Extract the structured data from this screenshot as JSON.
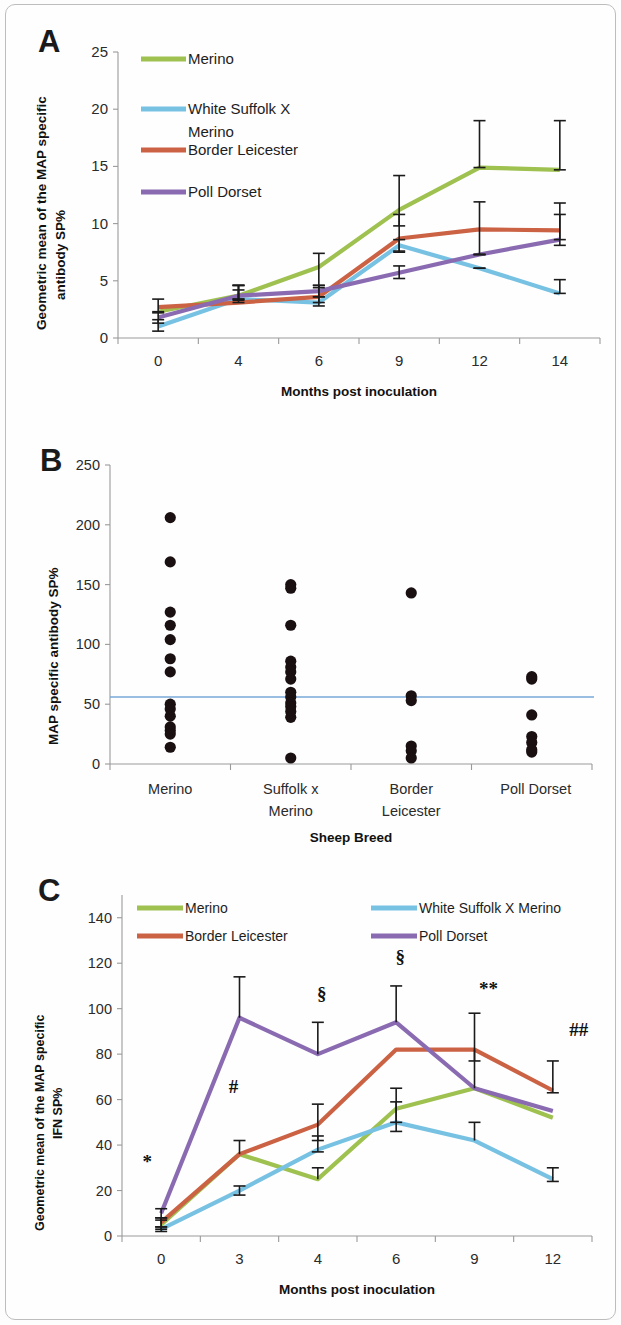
{
  "figure": {
    "panels": [
      "A",
      "B",
      "C"
    ],
    "colors": {
      "merino": "#9ec150",
      "white_suffolk_x_merino": "#77c1e3",
      "border_leicester": "#cb6244",
      "poll_dorset": "#8a6bb1",
      "threshold": "#77a9d8",
      "dot": "#1a1012",
      "axis": "#9a9a9a",
      "text": "#1d1d1d"
    }
  },
  "panel_a": {
    "letter": "A",
    "legend": [
      {
        "label": "Merino",
        "color_key": "merino"
      },
      {
        "label": "White Suffolk X Merino",
        "color_key": "white_suffolk_x_merino"
      },
      {
        "label": "Border Leicester",
        "color_key": "border_leicester"
      },
      {
        "label": "Poll Dorset",
        "color_key": "poll_dorset"
      }
    ],
    "chart_data": {
      "type": "line",
      "title": "",
      "xlabel": "Months post inoculation",
      "ylabel": "Geometric mean of the MAP specific antibody SP%",
      "categories": [
        "0",
        "4",
        "6",
        "9",
        "12",
        "14"
      ],
      "ylim": [
        0,
        25
      ],
      "yticks": [
        0,
        5,
        10,
        15,
        20,
        25
      ],
      "grid": false,
      "legend_position": "top-left inside",
      "series": [
        {
          "name": "Merino",
          "color_key": "merino",
          "values": [
            2.3,
            3.7,
            6.2,
            11.2,
            14.9,
            14.7
          ],
          "err_lower": [
            null,
            3.3,
            4.4,
            9.8,
            14.9,
            14.7
          ],
          "err_upper": [
            null,
            4.2,
            7.4,
            14.2,
            19.0,
            19.0
          ]
        },
        {
          "name": "White Suffolk X Merino",
          "color_key": "white_suffolk_x_merino",
          "values": [
            1.0,
            3.4,
            3.1,
            8.1,
            6.1,
            3.9
          ],
          "err_lower": [
            0.6,
            3.4,
            2.8,
            7.6,
            6.1,
            3.9
          ],
          "err_upper": [
            1.6,
            4.6,
            3.6,
            8.6,
            6.1,
            5.1
          ]
        },
        {
          "name": "Border Leicester",
          "color_key": "border_leicester",
          "values": [
            2.7,
            3.1,
            3.6,
            8.7,
            9.5,
            9.4
          ],
          "err_lower": [
            2.2,
            3.1,
            3.1,
            7.5,
            7.3,
            8.1
          ],
          "err_upper": [
            3.4,
            4.6,
            4.6,
            10.8,
            11.9,
            11.8
          ]
        },
        {
          "name": "Poll Dorset",
          "color_key": "poll_dorset",
          "values": [
            1.8,
            3.7,
            4.1,
            5.7,
            7.3,
            8.6
          ],
          "err_lower": [
            1.3,
            3.4,
            3.6,
            5.2,
            7.3,
            8.6
          ],
          "err_upper": [
            2.3,
            4.6,
            4.6,
            6.3,
            7.3,
            10.8
          ]
        }
      ]
    }
  },
  "panel_b": {
    "letter": "B",
    "chart_data": {
      "type": "scatter",
      "title": "",
      "xlabel": "Sheep Breed",
      "ylabel": "MAP specific antibody SP%",
      "categories": [
        "Merino",
        "Suffolk x Merino",
        "Border Leicester",
        "Poll Dorset"
      ],
      "ylim": [
        0,
        250
      ],
      "yticks": [
        0,
        50,
        100,
        150,
        200,
        250
      ],
      "grid": false,
      "threshold_value": 56,
      "threshold_color_key": "threshold",
      "groups": [
        {
          "name": "Merino",
          "values": [
            206,
            169,
            127,
            116,
            104,
            88,
            77,
            50,
            46,
            40,
            31,
            28,
            25,
            14
          ]
        },
        {
          "name": "Suffolk x Merino",
          "values": [
            150,
            147,
            116,
            86,
            81,
            77,
            71,
            60,
            56,
            51,
            48,
            44,
            39,
            5
          ]
        },
        {
          "name": "Border Leicester",
          "values": [
            143,
            57,
            53,
            15,
            11,
            5
          ]
        },
        {
          "name": "Poll Dorset",
          "values": [
            73,
            71,
            41,
            23,
            18,
            12,
            10
          ]
        }
      ]
    }
  },
  "panel_c": {
    "letter": "C",
    "legend": [
      {
        "label": "Merino",
        "color_key": "merino"
      },
      {
        "label": "White Suffolk X Merino",
        "color_key": "white_suffolk_x_merino"
      },
      {
        "label": "Border Leicester",
        "color_key": "border_leicester"
      },
      {
        "label": "Poll Dorset",
        "color_key": "poll_dorset"
      }
    ],
    "chart_data": {
      "type": "line",
      "title": "",
      "xlabel": "Months post inoculation",
      "ylabel": "Geometric mean of the MAP specific IFN SP%",
      "categories": [
        "0",
        "3",
        "4",
        "6",
        "9",
        "12"
      ],
      "ylim": [
        0,
        150
      ],
      "yticks": [
        0,
        20,
        40,
        60,
        80,
        100,
        120,
        140
      ],
      "grid": false,
      "legend_position": "top inside, two columns",
      "annotations": [
        {
          "text": "*",
          "x_category": "0",
          "y": 30
        },
        {
          "text": "#",
          "x_category": "3",
          "y": 63
        },
        {
          "text": "§",
          "x_category": "4",
          "y": 104
        },
        {
          "text": "§",
          "x_category": "6",
          "y": 120
        },
        {
          "text": "**",
          "x_category": "9",
          "y": 106
        },
        {
          "text": "##",
          "x_category": "12",
          "y": 88
        }
      ],
      "series": [
        {
          "name": "Merino",
          "color_key": "merino",
          "values": [
            5,
            36,
            25,
            56,
            65,
            52
          ],
          "err_lower": [
            3,
            36,
            25,
            50,
            65,
            52
          ],
          "err_upper": [
            8,
            36,
            30,
            65,
            65,
            52
          ]
        },
        {
          "name": "White Suffolk X Merino",
          "color_key": "white_suffolk_x_merino",
          "values": [
            3,
            20,
            38,
            50,
            42,
            25
          ],
          "err_lower": [
            2,
            18,
            37,
            46,
            42,
            24
          ],
          "err_upper": [
            4,
            22,
            44,
            59,
            50,
            30
          ]
        },
        {
          "name": "Border Leicester",
          "color_key": "border_leicester",
          "values": [
            6,
            36,
            49,
            82,
            82,
            64
          ],
          "err_lower": [
            4,
            36,
            42,
            82,
            77,
            63
          ],
          "err_upper": [
            8,
            42,
            58,
            82,
            82,
            77
          ]
        },
        {
          "name": "Poll Dorset",
          "color_key": "poll_dorset",
          "values": [
            10,
            96,
            80,
            94,
            65,
            55
          ],
          "err_lower": [
            7,
            96,
            80,
            94,
            65,
            55
          ],
          "err_upper": [
            12,
            114,
            94,
            110,
            98,
            55
          ]
        }
      ]
    }
  }
}
